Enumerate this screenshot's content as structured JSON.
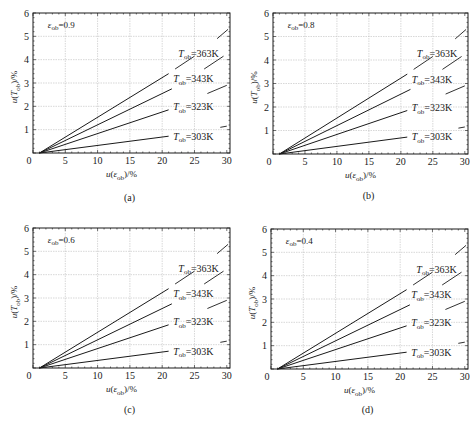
{
  "chart_data": [
    {
      "type": "line",
      "panel": "(a)",
      "annotation": {
        "symbol": "ε",
        "sub": "ob",
        "value": "=0.9"
      },
      "xlabel": "u(ε_ob)/%",
      "ylabel": "u(T_ob)/%",
      "xlim": [
        0,
        30.5
      ],
      "ylim": [
        0,
        6
      ],
      "xticks": [
        0,
        5,
        10,
        15,
        20,
        25,
        30
      ],
      "yticks": [
        1,
        2,
        3,
        4,
        5,
        6
      ],
      "ytick_zero_label": "",
      "grid": true,
      "series": [
        {
          "name": "T_ob=363K",
          "label_T": "T",
          "label_sub": "ob",
          "label_val": "=363K",
          "x": [
            1,
            21
          ],
          "y": [
            0,
            3.4
          ],
          "dash": {
            "x": [
              22,
              25
            ],
            "y": [
              3.6,
              4.15
            ]
          },
          "label_pos": [
            22.5,
            4.3
          ]
        },
        {
          "name": "T_ob=343K",
          "label_T": "T",
          "label_sub": "ob",
          "label_val": "=343K",
          "x": [
            1,
            21.5
          ],
          "y": [
            0,
            2.75
          ],
          "dash": {
            "x": [
              26.5,
              29.5
            ],
            "y": [
              3.6,
              4.15
            ]
          },
          "label_pos": [
            21.7,
            3.2
          ]
        },
        {
          "name": "T_ob=323K",
          "label_T": "T",
          "label_sub": "ob",
          "label_val": "=323K",
          "x": [
            1,
            21
          ],
          "y": [
            0,
            1.85
          ],
          "dash": {
            "x": [
              27,
              30
            ],
            "y": [
              2.55,
              2.9
            ]
          },
          "label_pos": [
            21.7,
            2.0
          ]
        },
        {
          "name": "T_ob=303K",
          "label_T": "T",
          "label_sub": "ob",
          "label_val": "=303K",
          "x": [
            1,
            21
          ],
          "y": [
            0,
            0.72
          ],
          "dash": {
            "x": [
              29,
              30
            ],
            "y": [
              1.1,
              1.15
            ]
          },
          "label_pos": [
            21.7,
            0.75
          ]
        }
      ],
      "extra_segment": {
        "x": [
          28.5,
          30.2
        ],
        "y": [
          4.9,
          5.3
        ]
      }
    },
    {
      "type": "line",
      "panel": "(b)",
      "annotation": {
        "symbol": "ε",
        "sub": "ob",
        "value": "=0.8"
      },
      "xlabel": "u(ε_ob)/%",
      "ylabel": "u(T_ob)/%",
      "xlim": [
        0,
        30.5
      ],
      "ylim": [
        0,
        6
      ],
      "xticks": [
        0,
        5,
        10,
        15,
        20,
        25,
        30
      ],
      "yticks": [
        1,
        2,
        3,
        4,
        5,
        6
      ],
      "grid": true,
      "series": [
        {
          "name": "T_ob=363K",
          "label_T": "T",
          "label_sub": "ob",
          "label_val": "=363K",
          "x": [
            1,
            21
          ],
          "y": [
            0,
            3.4
          ],
          "dash": {
            "x": [
              22,
              25
            ],
            "y": [
              3.6,
              4.15
            ]
          },
          "label_pos": [
            22.5,
            4.3
          ]
        },
        {
          "name": "T_ob=343K",
          "label_T": "T",
          "label_sub": "ob",
          "label_val": "=343K",
          "x": [
            1,
            21.5
          ],
          "y": [
            0,
            2.75
          ],
          "dash": {
            "x": [
              26.5,
              29.5
            ],
            "y": [
              3.6,
              4.15
            ]
          },
          "label_pos": [
            21.7,
            3.2
          ]
        },
        {
          "name": "T_ob=323K",
          "label_T": "T",
          "label_sub": "ob",
          "label_val": "=323K",
          "x": [
            1,
            21
          ],
          "y": [
            0,
            1.85
          ],
          "dash": {
            "x": [
              27,
              30
            ],
            "y": [
              2.55,
              2.9
            ]
          },
          "label_pos": [
            21.7,
            2.0
          ]
        },
        {
          "name": "T_ob=303K",
          "label_T": "T",
          "label_sub": "ob",
          "label_val": "=303K",
          "x": [
            1,
            21
          ],
          "y": [
            0,
            0.72
          ],
          "dash": {
            "x": [
              29,
              30
            ],
            "y": [
              1.1,
              1.15
            ]
          },
          "label_pos": [
            21.7,
            0.75
          ]
        }
      ],
      "extra_segment": {
        "x": [
          28.5,
          30.2
        ],
        "y": [
          4.9,
          5.3
        ]
      }
    },
    {
      "type": "line",
      "panel": "(c)",
      "annotation": {
        "symbol": "ε",
        "sub": "ob",
        "value": "=0.6"
      },
      "xlabel": "u(ε_ob)/%",
      "ylabel": "u(T_ob)/%",
      "xlim": [
        0,
        30.5
      ],
      "ylim": [
        0,
        6
      ],
      "xticks": [
        0,
        5,
        10,
        15,
        20,
        25,
        30
      ],
      "yticks": [
        1,
        2,
        3,
        4,
        5,
        6
      ],
      "grid": true,
      "series": [
        {
          "name": "T_ob=363K",
          "label_T": "T",
          "label_sub": "ob",
          "label_val": "=363K",
          "x": [
            1,
            21
          ],
          "y": [
            0,
            3.4
          ],
          "dash": {
            "x": [
              22,
              25
            ],
            "y": [
              3.6,
              4.15
            ]
          },
          "label_pos": [
            22.5,
            4.3
          ]
        },
        {
          "name": "T_ob=343K",
          "label_T": "T",
          "label_sub": "ob",
          "label_val": "=343K",
          "x": [
            1,
            21.5
          ],
          "y": [
            0,
            2.75
          ],
          "dash": {
            "x": [
              26.5,
              29.5
            ],
            "y": [
              3.6,
              4.15
            ]
          },
          "label_pos": [
            21.7,
            3.2
          ]
        },
        {
          "name": "T_ob=323K",
          "label_T": "T",
          "label_sub": "ob",
          "label_val": "=323K",
          "x": [
            1,
            21
          ],
          "y": [
            0,
            1.85
          ],
          "dash": {
            "x": [
              27,
              30
            ],
            "y": [
              2.55,
              2.9
            ]
          },
          "label_pos": [
            21.7,
            2.0
          ]
        },
        {
          "name": "T_ob=303K",
          "label_T": "T",
          "label_sub": "ob",
          "label_val": "=303K",
          "x": [
            1,
            21
          ],
          "y": [
            0,
            0.72
          ],
          "dash": {
            "x": [
              29,
              30
            ],
            "y": [
              1.1,
              1.15
            ]
          },
          "label_pos": [
            21.7,
            0.75
          ]
        }
      ],
      "extra_segment": {
        "x": [
          28.5,
          30.2
        ],
        "y": [
          4.9,
          5.3
        ]
      }
    },
    {
      "type": "line",
      "panel": "(d)",
      "annotation": {
        "symbol": "ε",
        "sub": "ob",
        "value": "=0.4"
      },
      "xlabel": "u(ε_ob)/%",
      "ylabel": "u(T_ob)/%",
      "xlim": [
        0,
        30.5
      ],
      "ylim": [
        0,
        6
      ],
      "xticks": [
        0,
        5,
        10,
        15,
        20,
        25,
        30
      ],
      "yticks": [
        1,
        2,
        3,
        4,
        5,
        6
      ],
      "grid": true,
      "series": [
        {
          "name": "T_ob=363K",
          "label_T": "T",
          "label_sub": "ob",
          "label_val": "=363K",
          "x": [
            1,
            21
          ],
          "y": [
            0,
            3.4
          ],
          "dash": {
            "x": [
              22,
              25
            ],
            "y": [
              3.6,
              4.15
            ]
          },
          "label_pos": [
            22.5,
            4.3
          ]
        },
        {
          "name": "T_ob=343K",
          "label_T": "T",
          "label_sub": "ob",
          "label_val": "=343K",
          "x": [
            1,
            21.5
          ],
          "y": [
            0,
            2.75
          ],
          "dash": {
            "x": [
              26.5,
              29.5
            ],
            "y": [
              3.6,
              4.15
            ]
          },
          "label_pos": [
            21.7,
            3.2
          ]
        },
        {
          "name": "T_ob=323K",
          "label_T": "T",
          "label_sub": "ob",
          "label_val": "=323K",
          "x": [
            1,
            21
          ],
          "y": [
            0,
            1.85
          ],
          "dash": {
            "x": [
              27,
              30
            ],
            "y": [
              2.55,
              2.9
            ]
          },
          "label_pos": [
            21.7,
            2.0
          ]
        },
        {
          "name": "T_ob=303K",
          "label_T": "T",
          "label_sub": "ob",
          "label_val": "=303K",
          "x": [
            1,
            21
          ],
          "y": [
            0,
            0.72
          ],
          "dash": {
            "x": [
              29,
              30
            ],
            "y": [
              1.1,
              1.15
            ]
          },
          "label_pos": [
            21.7,
            0.75
          ]
        }
      ],
      "extra_segment": {
        "x": [
          28.5,
          30.2
        ],
        "y": [
          4.9,
          5.3
        ]
      }
    }
  ],
  "layout": {
    "panels": [
      {
        "x0": 33,
        "x1": 230,
        "y0": 13,
        "y1": 153,
        "caption_y": 198
      },
      {
        "x0": 273,
        "x1": 468,
        "y0": 13,
        "y1": 154,
        "caption_y": 196
      },
      {
        "x0": 33,
        "x1": 230,
        "y0": 228,
        "y1": 368,
        "caption_y": 410
      },
      {
        "x0": 271,
        "x1": 468,
        "y0": 229,
        "y1": 369,
        "caption_y": 410
      }
    ],
    "colors": {
      "line": "#1a1a1a",
      "grid": "#bdbdbd",
      "axis": "#1a1a1a"
    }
  }
}
